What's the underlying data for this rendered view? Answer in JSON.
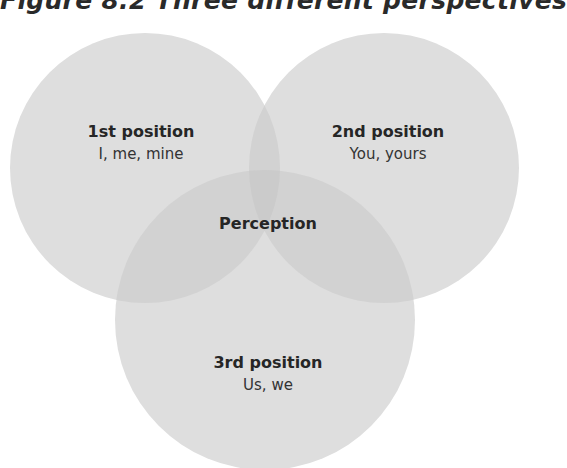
{
  "title": "Figure 8.2    Three different perspectives",
  "colors": {
    "circle_fill": "#dcdcdc",
    "overlap_fill": "#cfcfcf",
    "text": "#262626"
  },
  "diagram": {
    "type": "venn",
    "center_label": "Perception",
    "sets": [
      {
        "heading": "1st position",
        "subtext": "I, me, mine"
      },
      {
        "heading": "2nd position",
        "subtext": "You, yours"
      },
      {
        "heading": "3rd position",
        "subtext": "Us, we"
      }
    ]
  }
}
